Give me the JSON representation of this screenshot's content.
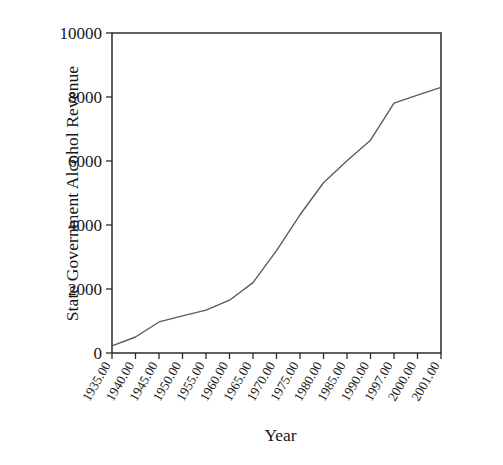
{
  "chart_data": {
    "type": "line",
    "title": "",
    "xlabel": "Year",
    "ylabel": "State Government Alcohol Revenue",
    "xlim": [
      1935,
      2001
    ],
    "ylim": [
      0,
      10000
    ],
    "grid": false,
    "legend": "none",
    "y_ticks": [
      "0",
      "2000",
      "4000",
      "6000",
      "8000",
      "10000"
    ],
    "y_tick_values": [
      0,
      2000,
      4000,
      6000,
      8000,
      10000
    ],
    "x_tick_labels": [
      "1935.00",
      "1940.00",
      "1945.00",
      "1950.00",
      "1955.00",
      "1960.00",
      "1965.00",
      "1970.00",
      "1975.00",
      "1980.00",
      "1985.00",
      "1990.00",
      "1997.00",
      "2000.00",
      "2001.00"
    ],
    "x_tick_rotation_deg": -60,
    "categories": [
      1935,
      1940,
      1945,
      1950,
      1955,
      1960,
      1965,
      1970,
      1975,
      1980,
      1985,
      1990,
      1997,
      2000,
      2001
    ],
    "values": [
      220,
      500,
      970,
      1160,
      1340,
      1650,
      2200,
      3200,
      4320,
      5320,
      6010,
      6650,
      7810,
      8060,
      8300
    ],
    "series": [
      {
        "name": "State Government Alcohol Revenue",
        "color": "#5a5a5a",
        "points": [
          {
            "x": 1935,
            "y": 220
          },
          {
            "x": 1940,
            "y": 500
          },
          {
            "x": 1945,
            "y": 970
          },
          {
            "x": 1950,
            "y": 1160
          },
          {
            "x": 1955,
            "y": 1340
          },
          {
            "x": 1960,
            "y": 1650
          },
          {
            "x": 1965,
            "y": 2200
          },
          {
            "x": 1970,
            "y": 3200
          },
          {
            "x": 1975,
            "y": 4320
          },
          {
            "x": 1980,
            "y": 5320
          },
          {
            "x": 1985,
            "y": 6010
          },
          {
            "x": 1990,
            "y": 6650
          },
          {
            "x": 1997,
            "y": 7810
          },
          {
            "x": 2000,
            "y": 8060
          },
          {
            "x": 2001,
            "y": 8300
          }
        ]
      }
    ],
    "colors": {
      "line": "#5a5a5a",
      "axis": "#2b2b2b",
      "text": "#171717",
      "background": "#ffffff"
    }
  }
}
